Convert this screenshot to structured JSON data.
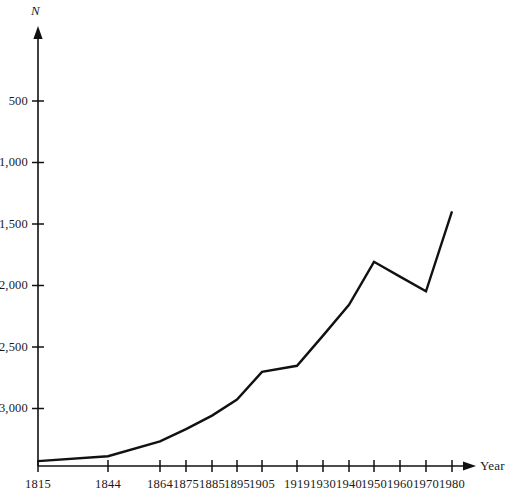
{
  "chart_data": {
    "type": "line",
    "title": "",
    "xlabel": "Year",
    "ylabel": "N",
    "x": [
      1815,
      1844,
      1864,
      1875,
      1885,
      1895,
      1905,
      1919,
      1930,
      1940,
      1950,
      1960,
      1970,
      1980
    ],
    "values": [
      40,
      80,
      200,
      300,
      410,
      540,
      765,
      815,
      1060,
      1310,
      1660,
      1540,
      1420,
      2070
    ],
    "xtick_labels": [
      "1815",
      "1844",
      "1864",
      "1875",
      "1885",
      "1895",
      "1905",
      "1919",
      "1930",
      "1940",
      "1950",
      "1960",
      "1970",
      "1980"
    ],
    "ytick_labels": [
      "500",
      "1,000",
      "1,500",
      "2,000",
      "2,500",
      "3,000"
    ],
    "ytick_values": [
      500,
      1000,
      1500,
      2000,
      2500,
      3000
    ],
    "ylim": [
      0,
      3300
    ],
    "xlim": [
      1815,
      1985
    ],
    "grid": false,
    "legend": "none",
    "line_color": "#111111",
    "axis_color": "#111111",
    "background_color": "#ffffff"
  },
  "axes": {
    "y_title": "N",
    "x_title": "Year"
  }
}
